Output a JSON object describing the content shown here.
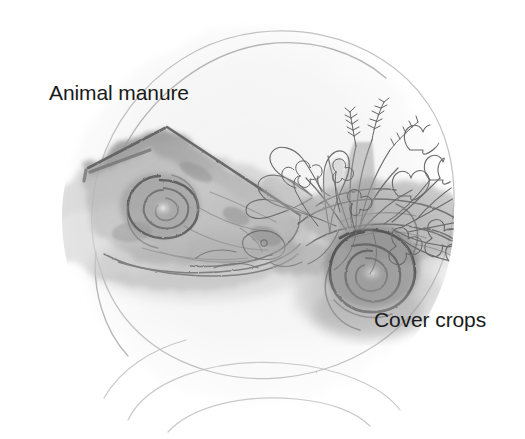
{
  "illustration": {
    "title": "Soil biology cycle pencil sketch",
    "medium": "graphite pencil drawing",
    "background_color": "#ffffff",
    "canvas": {
      "width": 525,
      "height": 439
    }
  },
  "labels": [
    {
      "id": "animal-manure",
      "text": "Animal manure",
      "color": "#1a1a1a",
      "x": 49,
      "y": 82
    },
    {
      "id": "cover-crops",
      "text": "Cover crops",
      "color": "#1a1a1a",
      "x": 374,
      "y": 309
    }
  ],
  "palette": {
    "paper": "#ffffff",
    "wash_light": "#ededed",
    "wash_mid": "#d8d8d8",
    "graphite_light": "#bdbdbd",
    "graphite_mid": "#9a9a9a",
    "graphite_dark": "#6f6f6f",
    "graphite_darkest": "#4a4a4a",
    "text": "#1a1a1a"
  },
  "elements": {
    "circle_outline": {
      "name": "faint pencil circle",
      "center_x": 258,
      "center_y": 218,
      "radius": 196
    },
    "bottom_arcs": {
      "name": "faint overlapping arcs at base",
      "count": 2
    },
    "soil_wedge": {
      "name": "animal manure soil wedge",
      "description": "triangular shaded block of soil at left with a spiral vortex"
    },
    "left_spiral": {
      "name": "soil spiral vortex left",
      "center_x": 160,
      "center_y": 206
    },
    "right_spiral": {
      "name": "soil spiral vortex right",
      "center_x": 370,
      "center_y": 263
    },
    "plants": {
      "name": "cover crop plants",
      "description": "clover heart-shaped leaves, grass seed heads and small flowers growing from the right soil mound"
    }
  }
}
